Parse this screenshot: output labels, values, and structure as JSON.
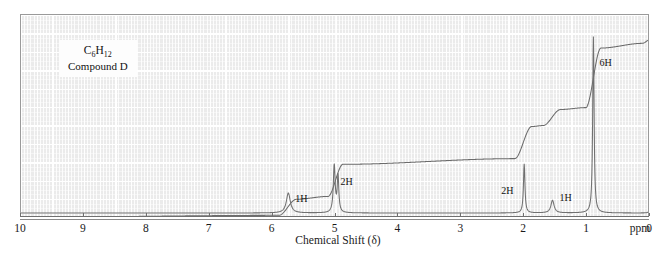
{
  "spectrum": {
    "compound_label": {
      "formula_prefix": "C",
      "formula_sub1": "6",
      "formula_mid": "H",
      "formula_sub2": "12",
      "name": "Compound D"
    },
    "axis": {
      "title": "Chemical Shift (δ)",
      "unit_label": "ppm",
      "ticks": [
        "10",
        "9",
        "8",
        "7",
        "6",
        "5",
        "4",
        "3",
        "2",
        "1",
        "0"
      ],
      "min": 0,
      "max": 10
    },
    "integration_labels": [
      {
        "text": "1H",
        "shift": 5.75
      },
      {
        "text": "2H",
        "shift": 5.0
      },
      {
        "text": "2H",
        "shift": 2.0
      },
      {
        "text": "1H",
        "shift": 1.55
      },
      {
        "text": "6H",
        "shift": 0.9
      }
    ]
  },
  "chart_data": {
    "type": "line",
    "title": "",
    "subtitle": "Compound D",
    "xlabel": "Chemical Shift (δ)",
    "ylabel": "",
    "xlim": [
      10,
      0
    ],
    "ylim": [
      0,
      1
    ],
    "grid": true,
    "legend": "none",
    "annotations": [
      "C6H12",
      "Compound D",
      "ppm"
    ],
    "series": [
      {
        "name": "NMR signal",
        "peaks": [
          {
            "shift": 5.75,
            "protons": 1,
            "height": 0.11,
            "width": 0.075,
            "multiplicity": "multiplet",
            "label": "1H"
          },
          {
            "shift": 5.02,
            "protons": 2,
            "height": 0.26,
            "width": 0.035,
            "multiplicity": "multiplet",
            "label": "2H"
          },
          {
            "shift": 4.96,
            "protons": 0,
            "height": 0.2,
            "width": 0.03,
            "multiplicity": "multiplet",
            "label": ""
          },
          {
            "shift": 2.0,
            "protons": 2,
            "height": 0.27,
            "width": 0.028,
            "multiplicity": "multiplet",
            "label": "2H"
          },
          {
            "shift": 1.55,
            "protons": 1,
            "height": 0.07,
            "width": 0.06,
            "multiplicity": "multiplet",
            "label": "1H"
          },
          {
            "shift": 0.9,
            "protons": 6,
            "height": 0.97,
            "width": 0.026,
            "multiplicity": "doublet",
            "label": "6H"
          },
          {
            "shift": 0.0,
            "protons": 0,
            "height": 0.1,
            "width": 0.014,
            "multiplicity": "singlet(TMS)",
            "label": ""
          }
        ]
      },
      {
        "name": "Integration trace",
        "steps": [
          {
            "shift": 10.0,
            "level": 0.02
          },
          {
            "shift": 5.9,
            "level": 0.03
          },
          {
            "shift": 5.62,
            "level": 0.115
          },
          {
            "shift": 5.12,
            "level": 0.13
          },
          {
            "shift": 4.88,
            "level": 0.3
          },
          {
            "shift": 2.15,
            "level": 0.33
          },
          {
            "shift": 1.88,
            "level": 0.5
          },
          {
            "shift": 1.7,
            "level": 0.505
          },
          {
            "shift": 1.42,
            "level": 0.59
          },
          {
            "shift": 1.02,
            "level": 0.6
          },
          {
            "shift": 0.78,
            "level": 0.915
          },
          {
            "shift": 0.12,
            "level": 0.94
          },
          {
            "shift": 0.0,
            "level": 0.96
          },
          {
            "shift": -0.3,
            "level": 0.96
          }
        ]
      }
    ]
  }
}
